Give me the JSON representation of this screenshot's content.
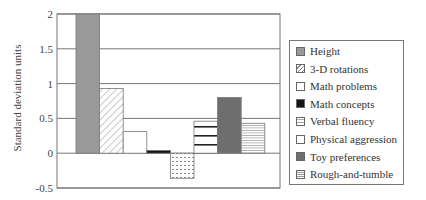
{
  "chart_data": {
    "type": "bar",
    "title": "",
    "xlabel": "",
    "ylabel": "Standard deviation units",
    "ylim": [
      -0.5,
      2
    ],
    "yticks": [
      2,
      1.5,
      1,
      0.5,
      0,
      -0.5
    ],
    "ytick_labels": [
      "2",
      "1.5",
      "1",
      "0.5",
      "0",
      "-0.5"
    ],
    "grid": true,
    "legend_position": "right",
    "categories": [
      "Height",
      "3-D rotations",
      "Math problems",
      "Math concepts",
      "Verbal fluency",
      "Physical aggression",
      "Toy preferences",
      "Rough-and-tumble"
    ],
    "values": [
      2.0,
      0.93,
      0.31,
      0.04,
      -0.36,
      0.46,
      0.8,
      0.43
    ],
    "series": [
      {
        "name": "Height",
        "value": 2.0,
        "fill": "#999999",
        "pattern": "solid"
      },
      {
        "name": "3-D rotations",
        "value": 0.93,
        "fill": "#ffffff",
        "pattern": "diagonal"
      },
      {
        "name": "Math problems",
        "value": 0.31,
        "fill": "#ffffff",
        "pattern": "none"
      },
      {
        "name": "Math concepts",
        "value": 0.04,
        "fill": "#1a1212",
        "pattern": "solid"
      },
      {
        "name": "Verbal fluency",
        "value": -0.36,
        "fill": "#ffffff",
        "pattern": "dots"
      },
      {
        "name": "Physical aggression",
        "value": 0.46,
        "fill": "#ffffff",
        "pattern": "thick-horizontal"
      },
      {
        "name": "Toy preferences",
        "value": 0.8,
        "fill": "#6e6e6e",
        "pattern": "solid"
      },
      {
        "name": "Rough-and-tumble",
        "value": 0.43,
        "fill": "#ffffff",
        "pattern": "fine-horizontal"
      }
    ]
  },
  "axis": {
    "ylabel": "Standard deviation units"
  },
  "legend": {
    "items": [
      "Height",
      "3-D rotations",
      "Math problems",
      "Math concepts",
      "Verbal fluency",
      "Physical aggression",
      "Toy preferences",
      "Rough-and-tumble"
    ]
  }
}
